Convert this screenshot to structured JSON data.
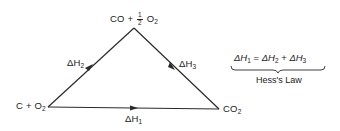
{
  "diagram": {
    "nodes": {
      "top": {
        "prefix": "CO + ",
        "frac_num": "1",
        "frac_den": "2",
        "suffix": "O",
        "suffix_sub": "2"
      },
      "left": {
        "text": "C + O",
        "sub": "2"
      },
      "right": {
        "text": "CO",
        "sub": "2"
      }
    },
    "edges": {
      "left_to_top": {
        "delta": "ΔH",
        "sub": "2"
      },
      "top_to_right": {
        "delta": "ΔH",
        "sub": "3"
      },
      "left_to_right": {
        "delta": "ΔH",
        "sub": "1"
      }
    },
    "equation": {
      "lhs": "ΔH",
      "lhs_sub": "1",
      "eq": " = ",
      "t1": "ΔH",
      "t1_sub": "2",
      "plus": " + ",
      "t2": "ΔH",
      "t2_sub": "3"
    },
    "law_label": "Hess's Law",
    "line_color": "#2a2a2a"
  }
}
